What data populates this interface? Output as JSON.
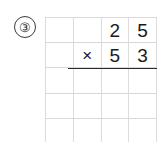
{
  "problem": {
    "number_label": "③",
    "number_plain": "3",
    "type": "long-multiplication",
    "multiplicand": "25",
    "multiplier": "53",
    "operator": "×",
    "answer_shown": false
  },
  "grid": {
    "columns": 4,
    "rows": 5,
    "line_color": "#dcdcdc",
    "rule_color": "#2a2a2a",
    "cells": [
      [
        "",
        "",
        "2",
        "5"
      ],
      [
        "",
        "×",
        "5",
        "3"
      ],
      [
        "",
        "",
        "",
        ""
      ],
      [
        "",
        "",
        "",
        ""
      ],
      [
        "",
        "",
        "",
        ""
      ]
    ]
  },
  "colors": {
    "background": "#ffffff",
    "ink": "#1a1a1a",
    "gridline": "#dcdcdc",
    "rule": "#2a2a2a"
  }
}
